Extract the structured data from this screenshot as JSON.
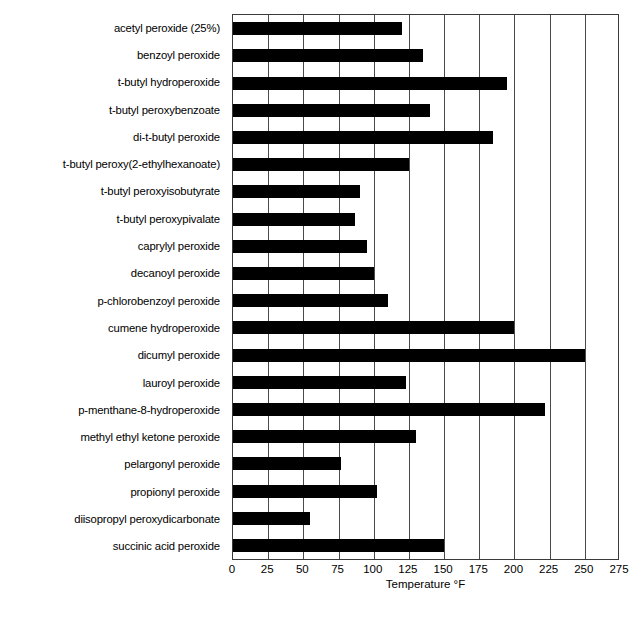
{
  "chart_data": {
    "type": "bar",
    "orientation": "horizontal",
    "title": "",
    "xlabel": "Temperature °F",
    "ylabel": "",
    "xlim": [
      0,
      275
    ],
    "xticks": [
      0,
      25,
      50,
      75,
      100,
      125,
      150,
      175,
      200,
      225,
      250,
      275
    ],
    "xtick_labels": [
      "0",
      "25",
      "50",
      "75",
      "100",
      "125",
      "150",
      "175",
      "200",
      "225",
      "250",
      "275"
    ],
    "grid": true,
    "grid_axis": "x",
    "legend": false,
    "bar_color": "#000000",
    "plot_background": "#ffffff",
    "axis_color": "#3a3a3a",
    "categories": [
      "acetyl peroxide (25%)",
      "benzoyl peroxide",
      "t-butyl hydroperoxide",
      "t-butyl peroxybenzoate",
      "di-t-butyl peroxide",
      "t-butyl peroxy(2-ethylhexanoate)",
      "t-butyl peroxyisobutyrate",
      "t-butyl peroxypivalate",
      "caprylyl peroxide",
      "decanoyl peroxide",
      "p-chlorobenzoyl peroxide",
      "cumene hydroperoxide",
      "dicumyl peroxide",
      "lauroyl peroxide",
      "p-menthane-8-hydroperoxide",
      "methyl ethyl ketone peroxide",
      "pelargonyl peroxide",
      "propionyl peroxide",
      "diisopropyl peroxydicarbonate",
      "succinic acid peroxide"
    ],
    "values": [
      120,
      135,
      195,
      140,
      185,
      125,
      90,
      87,
      95,
      100,
      110,
      200,
      250,
      123,
      222,
      130,
      77,
      102,
      55,
      150
    ]
  }
}
